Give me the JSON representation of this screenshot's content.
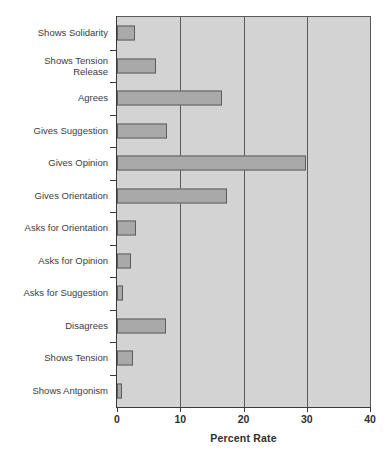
{
  "chart_data": {
    "type": "bar",
    "orientation": "horizontal",
    "title": "",
    "xlabel": "Percent Rate",
    "ylabel": "",
    "xlim": [
      0,
      40
    ],
    "xticks": [
      0,
      10,
      20,
      30,
      40
    ],
    "xtick_labels": [
      "0",
      "10",
      "20",
      "30",
      "40"
    ],
    "grid": "vertical",
    "legend": "none",
    "categories": [
      "Shows Solidarity",
      "Shows Tension\nRelease",
      "Agrees",
      "Gives Suggestion",
      "Gives Opinion",
      "Gives Orientation",
      "Asks for Orientation",
      "Asks for Opinion",
      "Asks for Suggestion",
      "Disagrees",
      "Shows Tension",
      "Shows Antgonism"
    ],
    "values": [
      2.8,
      6.2,
      16.6,
      7.9,
      29.9,
      17.4,
      3.0,
      2.2,
      1.0,
      7.8,
      2.5,
      0.8
    ],
    "bar_color": "#a9a9a9",
    "bar_edge_color": "#5c5c5c",
    "plot_background": "#d3d3d3",
    "axis_color": "#3a3a3a"
  }
}
